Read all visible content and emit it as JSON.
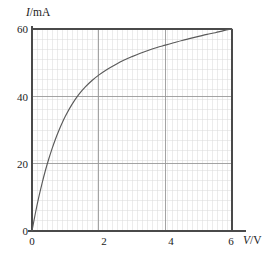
{
  "figure": {
    "name": "current-voltage-characteristic-graph",
    "background_color": "#ffffff",
    "width": 273,
    "height": 256
  },
  "axes": {
    "y_title_variable": "I",
    "y_title_unit": "/mA",
    "x_title_variable": "V",
    "x_title_unit": "/V",
    "axis_color": "#4a4a4a",
    "major_grid_color": "#9a9a9a",
    "minor_grid_color": "#d9d9d9",
    "curve_color": "#5a5a5a"
  },
  "chart_data": {
    "type": "line",
    "title": "",
    "subtitle": "",
    "xlabel": "V/V",
    "ylabel": "I/mA",
    "xlim": [
      0,
      6
    ],
    "ylim": [
      0,
      60
    ],
    "grid": true,
    "minor_grid": true,
    "minor_grid_step_x": 0.15,
    "minor_grid_step_y": 3,
    "legend": "none",
    "x_ticks": [
      0,
      2,
      4,
      6
    ],
    "x_tick_labels": [
      "0",
      "2",
      "4",
      "6"
    ],
    "y_ticks": [
      0,
      20,
      40,
      60
    ],
    "y_tick_labels": [
      "0",
      "20",
      "40",
      "60"
    ],
    "series": [
      {
        "name": "I-V characteristic",
        "color": "#5a5a5a",
        "x": [
          0,
          0.1,
          0.2,
          0.3,
          0.4,
          0.5,
          0.6,
          0.7,
          0.8,
          0.9,
          1.0,
          1.2,
          1.4,
          1.6,
          1.8,
          2.0,
          2.25,
          2.5,
          2.75,
          3.0,
          3.25,
          3.5,
          3.75,
          4.0,
          4.25,
          4.5,
          4.75,
          5.0,
          5.25,
          5.5,
          5.75,
          6.0
        ],
        "y": [
          0,
          5.2,
          9.9,
          14.1,
          17.9,
          21.3,
          24.4,
          27.2,
          29.7,
          32.0,
          34.1,
          37.6,
          40.5,
          42.8,
          44.7,
          46.3,
          48.0,
          49.4,
          50.7,
          51.8,
          52.8,
          53.7,
          54.5,
          55.2,
          55.9,
          56.6,
          57.2,
          57.8,
          58.4,
          58.9,
          59.5,
          60.0
        ]
      }
    ],
    "annotations": []
  },
  "geometry": {
    "plot_left_px": 32,
    "plot_right_px": 232,
    "plot_top_px": 29,
    "plot_bottom_px": 231,
    "x_axis_overrun_px": 14
  }
}
